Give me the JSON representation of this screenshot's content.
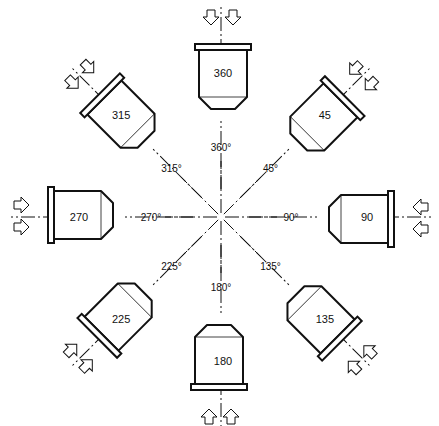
{
  "diagram": {
    "center": [
      221,
      217
    ],
    "containers": [
      {
        "angle": 0,
        "number_label": "360",
        "angle_label": "360°"
      },
      {
        "angle": 45,
        "number_label": "45",
        "angle_label": "45°"
      },
      {
        "angle": 90,
        "number_label": "90",
        "angle_label": "90°"
      },
      {
        "angle": 135,
        "number_label": "135",
        "angle_label": "135°"
      },
      {
        "angle": 180,
        "number_label": "180",
        "angle_label": "180°"
      },
      {
        "angle": 225,
        "number_label": "225",
        "angle_label": "225°"
      },
      {
        "angle": 270,
        "number_label": "270",
        "angle_label": "270°"
      },
      {
        "angle": 315,
        "number_label": "315",
        "angle_label": "315°"
      }
    ],
    "arrow_icon": "hollow-arrow-icon",
    "line_color": "#111111"
  },
  "caption": ""
}
